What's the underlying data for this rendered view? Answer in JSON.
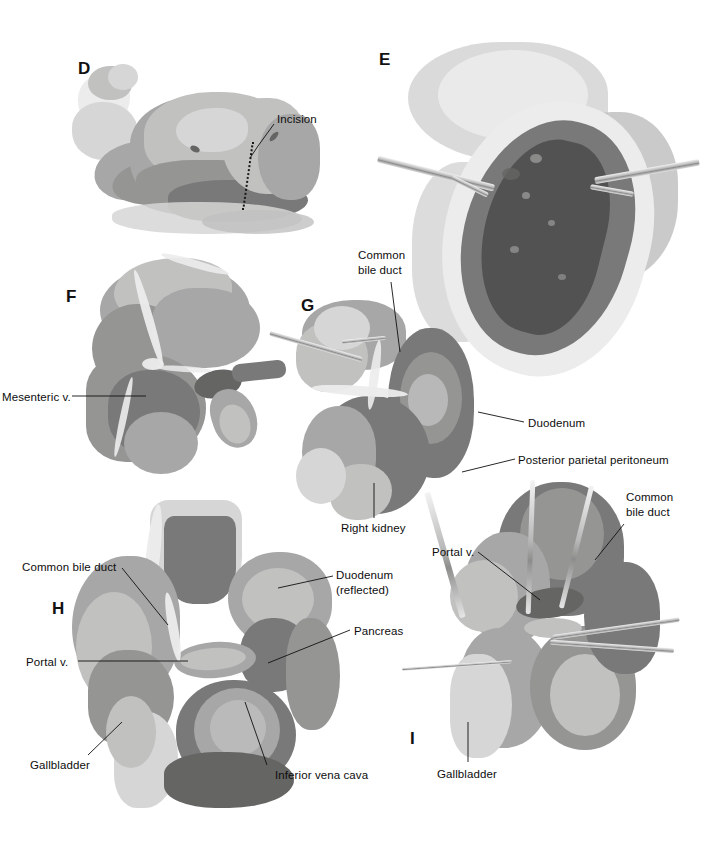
{
  "plate": {
    "title": "Surgical exposure of the common bile duct — operative illustration plate",
    "width": 710,
    "height": 864,
    "background_color": "#ffffff",
    "ink_color": "#111111",
    "style": "grayscale watercolor / wash medical illustration"
  },
  "panels": [
    {
      "id": "D",
      "letter": "D",
      "caption": "Patient positioned in left lateral decubitus with planned right subcostal incision marked",
      "letter_pos": {
        "x": 78,
        "y": 60
      },
      "labels": [
        {
          "name": "incision",
          "text": "Incision",
          "pos": {
            "x": 277,
            "y": 112
          },
          "align": "left",
          "leader": [
            [
              274,
              124
            ],
            [
              258,
              146
            ],
            [
              250,
              158
            ]
          ]
        }
      ]
    },
    {
      "id": "E",
      "letter": "E",
      "caption": "Abdomen opened; self-retaining retractors expose the liver through the subcostal incision",
      "letter_pos": {
        "x": 379,
        "y": 51
      },
      "labels": []
    },
    {
      "id": "F",
      "letter": "F",
      "caption": "Exposure of the mesenteric vessels at the root of the mesentery",
      "letter_pos": {
        "x": 66,
        "y": 288
      },
      "labels": [
        {
          "name": "mesenteric-vein",
          "text": "Mesenteric v.",
          "pos": {
            "x": 2,
            "y": 390
          },
          "align": "left",
          "leader": [
            [
              72,
              396
            ],
            [
              146,
              396
            ]
          ]
        }
      ]
    },
    {
      "id": "G",
      "letter": "G",
      "caption": "Kocher maneuver: incising the posterior parietal peritoneum lateral to the duodenum",
      "letter_pos": {
        "x": 301,
        "y": 297
      },
      "labels": [
        {
          "name": "common-bile-duct",
          "text": "Common\nbile duct",
          "pos": {
            "x": 358,
            "y": 248
          },
          "align": "left",
          "leader": [
            [
              391,
              282
            ],
            [
              400,
              352
            ]
          ]
        },
        {
          "name": "duodenum",
          "text": "Duodenum",
          "pos": {
            "x": 528,
            "y": 416
          },
          "align": "left",
          "leader": [
            [
              524,
              422
            ],
            [
              478,
              412
            ]
          ]
        },
        {
          "name": "posterior-parietal-peritoneum",
          "text": "Posterior parietal peritoneum",
          "pos": {
            "x": 518,
            "y": 453
          },
          "align": "left",
          "leader": [
            [
              515,
              459
            ],
            [
              462,
              472
            ]
          ]
        },
        {
          "name": "right-kidney",
          "text": "Right kidney",
          "pos": {
            "x": 341,
            "y": 521
          },
          "align": "left",
          "leader": [
            [
              374,
              518
            ],
            [
              374,
              483
            ]
          ]
        }
      ]
    },
    {
      "id": "H",
      "letter": "H",
      "caption": "Duodenum reflected medially exposing the portal vein, pancreas and inferior vena cava",
      "letter_pos": {
        "x": 52,
        "y": 600
      },
      "labels": [
        {
          "name": "common-bile-duct",
          "text": "Common bile duct",
          "pos": {
            "x": 22,
            "y": 560
          },
          "align": "left",
          "leader": [
            [
              122,
              568
            ],
            [
              168,
              625
            ]
          ]
        },
        {
          "name": "portal-vein",
          "text": "Portal v.",
          "pos": {
            "x": 26,
            "y": 655
          },
          "align": "left",
          "leader": [
            [
              78,
              661
            ],
            [
              188,
              661
            ]
          ]
        },
        {
          "name": "duodenum-reflected",
          "text": "Duodenum\n(reflected)",
          "pos": {
            "x": 336,
            "y": 568
          },
          "align": "left",
          "leader": [
            [
              333,
              576
            ],
            [
              278,
              588
            ]
          ]
        },
        {
          "name": "pancreas",
          "text": "Pancreas",
          "pos": {
            "x": 354,
            "y": 624
          },
          "align": "left",
          "leader": [
            [
              350,
              630
            ],
            [
              268,
              663
            ]
          ]
        },
        {
          "name": "gallbladder",
          "text": "Gallbladder",
          "pos": {
            "x": 30,
            "y": 758
          },
          "align": "left",
          "leader": [
            [
              88,
              755
            ],
            [
              122,
              722
            ]
          ]
        },
        {
          "name": "inferior-vena-cava",
          "text": "Inferior vena cava",
          "pos": {
            "x": 275,
            "y": 768
          },
          "align": "left",
          "leader": [
            [
              267,
              765
            ],
            [
              245,
              702
            ]
          ]
        }
      ]
    },
    {
      "id": "I",
      "letter": "I",
      "caption": "Common bile duct encircled; portal vein and gallbladder in view",
      "letter_pos": {
        "x": 410,
        "y": 730
      },
      "labels": [
        {
          "name": "common-bile-duct",
          "text": "Common\nbile duct",
          "pos": {
            "x": 626,
            "y": 490
          },
          "align": "left",
          "leader": [
            [
              624,
              524
            ],
            [
              595,
              560
            ]
          ]
        },
        {
          "name": "portal-vein",
          "text": "Portal v.",
          "pos": {
            "x": 432,
            "y": 545
          },
          "align": "left",
          "leader": [
            [
              478,
              552
            ],
            [
              540,
              600
            ]
          ]
        },
        {
          "name": "gallbladder",
          "text": "Gallbladder",
          "pos": {
            "x": 437,
            "y": 767
          },
          "align": "left",
          "leader": [
            [
              468,
              762
            ],
            [
              468,
              722
            ]
          ]
        }
      ]
    }
  ],
  "palette": {
    "paper": "#ffffff",
    "ink": "#111111",
    "tissue_pale": "#d6d4d1",
    "tissue_light": "#c2bfbb",
    "tissue_mid": "#a9a6a2",
    "tissue_dark": "#7c7975",
    "tissue_deep": "#56534e",
    "highlight": "#eceae7"
  }
}
